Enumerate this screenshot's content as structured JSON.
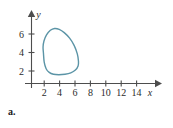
{
  "figure": {
    "panel_label": "a.",
    "background_color": "#ffffff",
    "axis_color": "#4d4d4d",
    "curve_color": "#5b94a6"
  },
  "chart_data": {
    "type": "line",
    "title": "",
    "subtitle": "",
    "xlabel": "x",
    "ylabel": "y",
    "xlim": [
      0,
      15.4
    ],
    "ylim": [
      0,
      7.4
    ],
    "xticks": [
      2,
      4,
      6,
      8,
      10,
      12,
      14
    ],
    "xtick_labels": [
      "2",
      "4",
      "6",
      "8",
      "10",
      "12",
      "14"
    ],
    "yticks": [
      2,
      4,
      6
    ],
    "ytick_labels": [
      "2",
      "4",
      "6"
    ],
    "grid": false,
    "legend": "none",
    "annotations": [
      "a."
    ],
    "series": [
      {
        "name": "closed-curve",
        "closed": true,
        "color": "#5b94a6",
        "x": [
          1.55,
          1.5,
          1.62,
          1.95,
          2.45,
          3.0,
          3.6,
          4.25,
          4.95,
          5.55,
          5.95,
          6.1,
          6.05,
          5.7,
          5.1,
          4.35,
          3.55,
          2.85,
          2.3,
          1.9,
          1.65,
          1.55
        ],
        "y": [
          3.3,
          3.95,
          4.6,
          5.25,
          5.75,
          5.95,
          5.85,
          5.5,
          4.9,
          4.1,
          3.2,
          2.4,
          1.9,
          1.45,
          1.15,
          1.0,
          0.95,
          1.0,
          1.2,
          1.6,
          2.3,
          3.3
        ]
      }
    ]
  }
}
